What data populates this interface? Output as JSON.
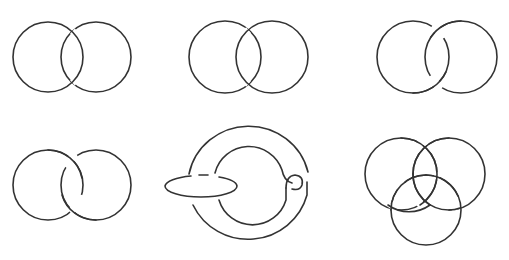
{
  "figure": {
    "stroke_color": "#333333",
    "background": "#ffffff",
    "diagrams": [
      {
        "id": "unlink-left-over",
        "row": 1,
        "col": 1,
        "kind": "two overlapping circles, left circle over at both crossings (unlink)"
      },
      {
        "id": "unlink-right-over",
        "row": 1,
        "col": 2,
        "kind": "two overlapping circles, right circle over at both crossings (unlink)"
      },
      {
        "id": "hopf-link-a",
        "row": 1,
        "col": 3,
        "kind": "two circles, right over at top, left over at bottom (Hopf link)"
      },
      {
        "id": "hopf-link-b",
        "row": 2,
        "col": 1,
        "kind": "two circles, left over at top, right over at bottom (Hopf link)"
      },
      {
        "id": "whitehead-like-link",
        "row": 2,
        "col": 2,
        "kind": "clasped ring with horizontal ellipse threaded through"
      },
      {
        "id": "borromean-rings",
        "row": 2,
        "col": 3,
        "kind": "three mutually interlocked circles (Borromean rings)"
      }
    ]
  }
}
